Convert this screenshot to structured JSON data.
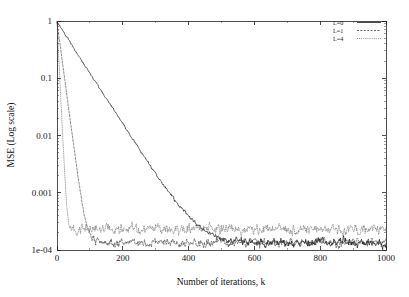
{
  "chart_data": {
    "type": "line",
    "title": "",
    "xlabel": "Number of iterations, k",
    "ylabel": "MSE (Log scale)",
    "xlim": [
      0,
      1000
    ],
    "ylim": [
      0.0001,
      1
    ],
    "yscale": "log",
    "xscale": "linear",
    "grid": false,
    "legend_position": "top-right",
    "x_ticks": [
      0,
      200,
      400,
      600,
      800,
      1000
    ],
    "x_tick_labels": [
      "0",
      "200",
      "400",
      "600",
      "800",
      "1000"
    ],
    "y_ticks": [
      1,
      0.1,
      0.01,
      0.001,
      0.0001
    ],
    "y_tick_labels": [
      "1",
      "0.1",
      "0.01",
      "0.001",
      "1e-04"
    ],
    "series": [
      {
        "name": "L=0",
        "style": "solid",
        "color": "#000000",
        "initial_value": 0.95,
        "decay_rate_per_iteration": 0.0205,
        "noise_floor": 0.000132,
        "floor_reached_at_k": 520,
        "noise_amplitude_db": 0.16,
        "x": [
          0,
          20,
          40,
          60,
          80,
          100,
          140,
          180,
          220,
          260,
          300,
          340,
          380,
          420,
          460,
          500,
          540,
          600,
          700,
          800,
          900,
          1000
        ],
        "y": [
          0.95,
          0.63,
          0.42,
          0.28,
          0.185,
          0.122,
          0.054,
          0.0235,
          0.0104,
          0.0046,
          0.00205,
          0.00094,
          0.00046,
          0.00026,
          0.000175,
          0.000145,
          0.000136,
          0.000133,
          0.000132,
          0.000131,
          0.000132,
          0.000131
        ]
      },
      {
        "name": "L=1",
        "style": "dashed",
        "color": "#2b2b2b",
        "initial_value": 0.95,
        "decay_rate_per_iteration": 0.098,
        "noise_floor": 0.000135,
        "floor_reached_at_k": 115,
        "noise_amplitude_db": 0.17,
        "x": [
          0,
          10,
          20,
          30,
          40,
          50,
          60,
          70,
          80,
          90,
          100,
          110,
          130,
          160,
          200,
          300,
          400,
          500,
          600,
          700,
          800,
          900,
          1000
        ],
        "y": [
          0.95,
          0.36,
          0.135,
          0.051,
          0.0192,
          0.0072,
          0.0027,
          0.00102,
          0.00048,
          0.00027,
          0.000185,
          0.000148,
          0.000138,
          0.000136,
          0.000135,
          0.000134,
          0.000135,
          0.000133,
          0.000134,
          0.000135,
          0.000133,
          0.000134,
          0.000133
        ]
      },
      {
        "name": "L=4",
        "style": "dotted",
        "color": "#5a5a5a",
        "initial_value": 0.95,
        "decay_rate_per_iteration": 0.265,
        "noise_floor": 0.000232,
        "floor_reached_at_k": 42,
        "noise_amplitude_db": 0.2,
        "x": [
          0,
          5,
          10,
          15,
          20,
          25,
          30,
          35,
          40,
          50,
          70,
          100,
          200,
          300,
          400,
          500,
          600,
          700,
          800,
          900,
          1000
        ],
        "y": [
          0.95,
          0.25,
          0.066,
          0.0176,
          0.0047,
          0.00125,
          0.00046,
          0.00029,
          0.000245,
          0.000235,
          0.000233,
          0.000232,
          0.000231,
          0.000233,
          0.000232,
          0.000234,
          0.000231,
          0.000233,
          0.000232,
          0.000234,
          0.000232
        ]
      }
    ],
    "annotations": []
  },
  "axes": {
    "x_label": "Number of iterations, k",
    "y_label": "MSE (Log scale)",
    "x_tick_labels": [
      "0",
      "200",
      "400",
      "600",
      "800",
      "1000"
    ],
    "y_tick_labels": [
      "1",
      "0.1",
      "0.01",
      "0.001",
      "1e-04"
    ]
  },
  "legend": {
    "entries": [
      {
        "label": "L=0"
      },
      {
        "label": "L=1"
      },
      {
        "label": "L=4"
      }
    ]
  },
  "colors": {
    "background": "#ffffff",
    "frame": "#222222",
    "series_l0": "#000000",
    "series_l1": "#2b2b2b",
    "series_l4": "#5a5a5a"
  }
}
